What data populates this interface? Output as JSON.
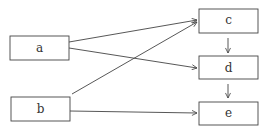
{
  "diagram": {
    "nodes": [
      {
        "id": "a",
        "label": "a",
        "x": 10,
        "y": 36,
        "w": 59,
        "h": 24
      },
      {
        "id": "b",
        "label": "b",
        "x": 11,
        "y": 97,
        "w": 59,
        "h": 24
      },
      {
        "id": "c",
        "label": "c",
        "x": 199,
        "y": 9,
        "w": 59,
        "h": 24
      },
      {
        "id": "d",
        "label": "d",
        "x": 199,
        "y": 56,
        "w": 59,
        "h": 23
      },
      {
        "id": "e",
        "label": "e",
        "x": 199,
        "y": 102,
        "w": 59,
        "h": 23
      }
    ],
    "edges": [
      {
        "from": "a",
        "to": "c"
      },
      {
        "from": "a",
        "to": "d"
      },
      {
        "from": "b",
        "to": "c"
      },
      {
        "from": "b",
        "to": "e"
      },
      {
        "from": "c",
        "to": "d"
      },
      {
        "from": "d",
        "to": "e"
      }
    ],
    "colors": {
      "stroke": "#444444",
      "text": "#333333",
      "background": "#ffffff"
    }
  }
}
